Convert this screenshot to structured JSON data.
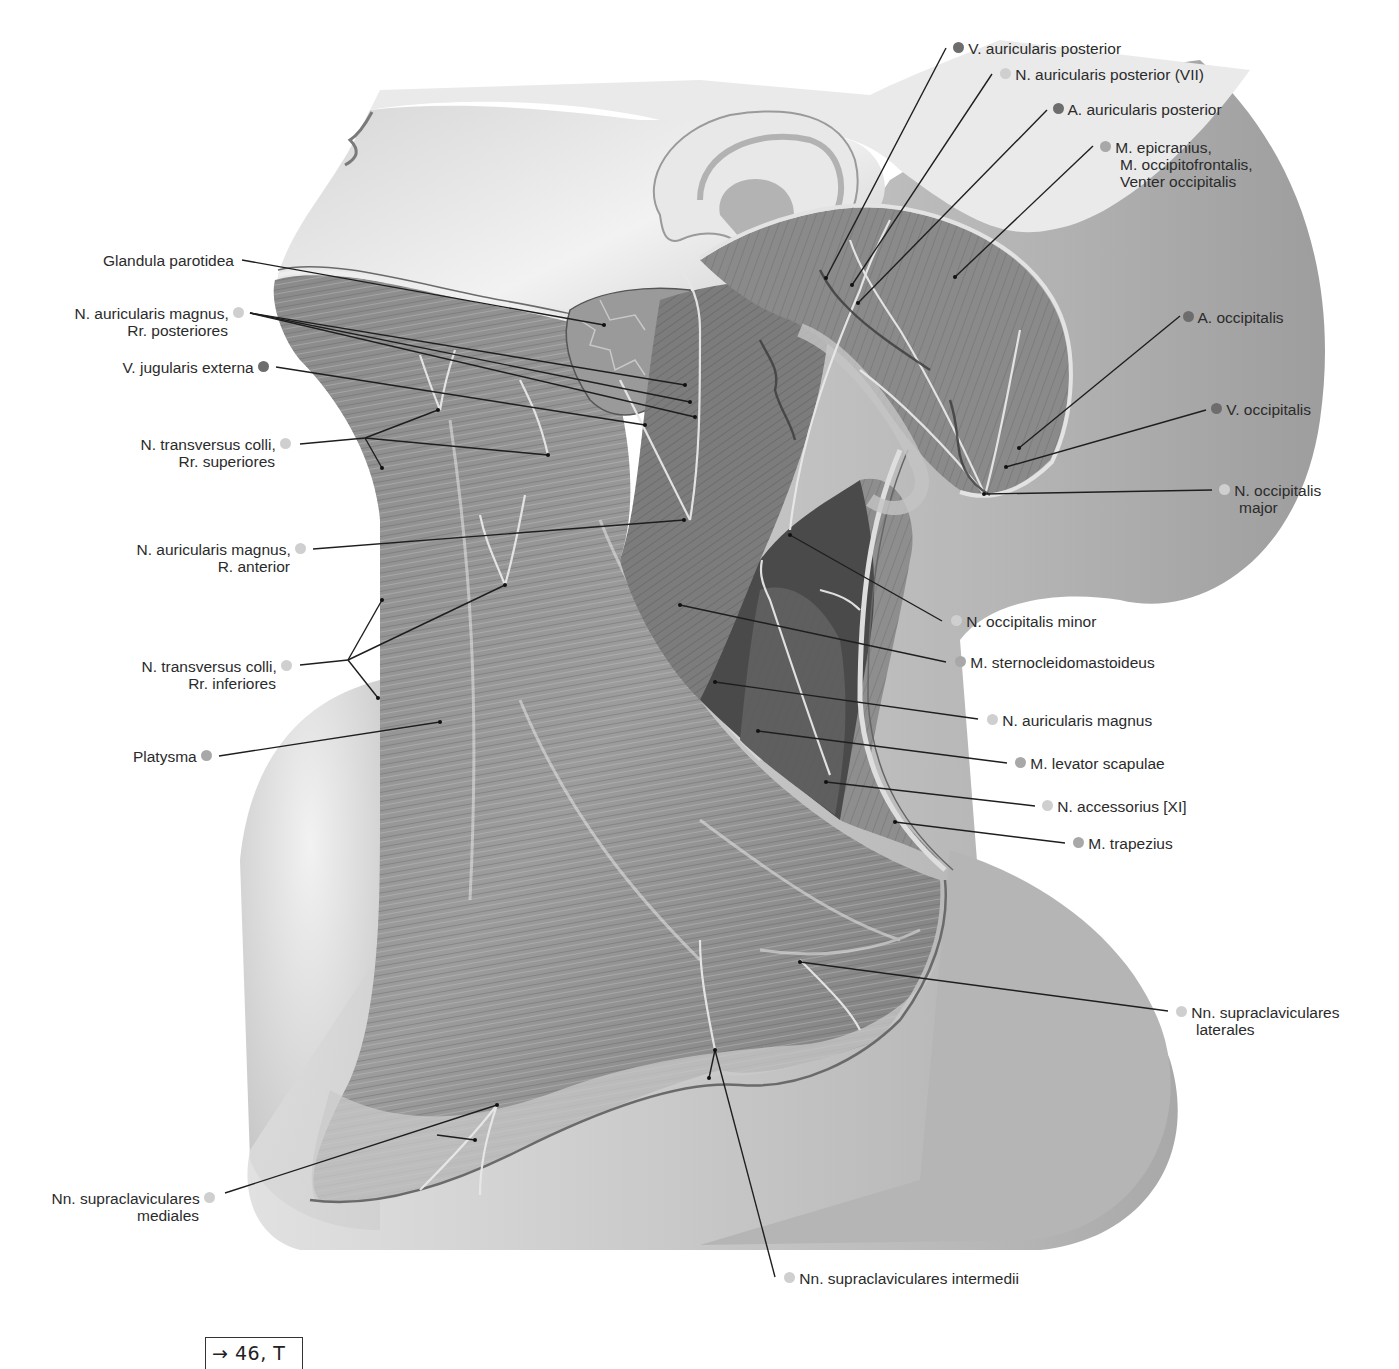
{
  "figure": {
    "legend_colors": {
      "nerve": "#cfcfcf",
      "vessel": "#6d6d6d",
      "muscle": "#a8a8a8"
    }
  },
  "labels_left": [
    {
      "id": "glandula-parotidea",
      "text": "Glandula parotidea",
      "line2": "",
      "type": "gland"
    },
    {
      "id": "n-auricularis-magnus-rr-post",
      "text": "N. auricularis magnus,",
      "line2": "Rr. posteriores",
      "type": "nerve"
    },
    {
      "id": "v-jugularis-externa",
      "text": "V. jugularis externa",
      "line2": "",
      "type": "vessel"
    },
    {
      "id": "n-transversus-colli-rr-sup",
      "text": "N. transversus colli,",
      "line2": "Rr. superiores",
      "type": "nerve"
    },
    {
      "id": "n-auricularis-magnus-r-ant",
      "text": "N. auricularis magnus,",
      "line2": "R. anterior",
      "type": "nerve"
    },
    {
      "id": "n-transversus-colli-rr-inf",
      "text": "N. transversus colli,",
      "line2": "Rr. inferiores",
      "type": "nerve"
    },
    {
      "id": "platysma",
      "text": "Platysma",
      "line2": "",
      "type": "muscle"
    },
    {
      "id": "nn-supraclaviculares-med",
      "text": "Nn. supraclaviculares",
      "line2": "mediales",
      "type": "nerve"
    }
  ],
  "labels_right": [
    {
      "id": "v-auricularis-post",
      "text": "V. auricularis posterior",
      "line2": "",
      "line3": "",
      "type": "vessel"
    },
    {
      "id": "n-auricularis-post",
      "text": "N. auricularis posterior (VII)",
      "line2": "",
      "line3": "",
      "type": "nerve"
    },
    {
      "id": "a-auricularis-post",
      "text": "A. auricularis posterior",
      "line2": "",
      "line3": "",
      "type": "vessel"
    },
    {
      "id": "m-epicranius",
      "text": "M. epicranius,",
      "line2": "M. occipitofrontalis,",
      "line3": "Venter occipitalis",
      "type": "muscle"
    },
    {
      "id": "a-occipitalis",
      "text": "A. occipitalis",
      "line2": "",
      "line3": "",
      "type": "vessel"
    },
    {
      "id": "v-occipitalis",
      "text": "V. occipitalis",
      "line2": "",
      "line3": "",
      "type": "vessel"
    },
    {
      "id": "n-occipitalis-major",
      "text": "N. occipitalis",
      "line2": "major",
      "line3": "",
      "type": "nerve"
    },
    {
      "id": "n-occipitalis-minor",
      "text": "N. occipitalis minor",
      "line2": "",
      "line3": "",
      "type": "nerve"
    },
    {
      "id": "m-sternocleidomastoideus",
      "text": "M. sternocleidomastoideus",
      "line2": "",
      "line3": "",
      "type": "muscle"
    },
    {
      "id": "n-auricularis-magnus",
      "text": "N. auricularis magnus",
      "line2": "",
      "line3": "",
      "type": "nerve"
    },
    {
      "id": "m-levator-scapulae",
      "text": "M. levator scapulae",
      "line2": "",
      "line3": "",
      "type": "muscle"
    },
    {
      "id": "n-accessorius",
      "text": "N. accessorius [XI]",
      "line2": "",
      "line3": "",
      "type": "nerve"
    },
    {
      "id": "m-trapezius",
      "text": "M. trapezius",
      "line2": "",
      "line3": "",
      "type": "muscle"
    },
    {
      "id": "nn-supraclaviculares-lat",
      "text": "Nn. supraclaviculares",
      "line2": "laterales",
      "line3": "",
      "type": "nerve"
    }
  ],
  "labels_bottom": [
    {
      "id": "nn-supraclaviculares-int",
      "text": "Nn. supraclaviculares intermedii",
      "type": "nerve"
    }
  ],
  "cross_reference": {
    "text": "→ 46, T 7"
  }
}
